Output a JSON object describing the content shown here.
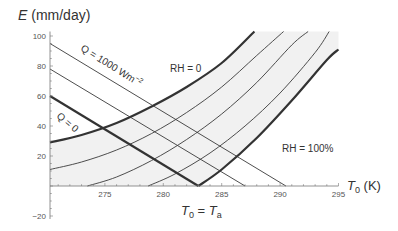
{
  "chart_data": {
    "type": "line",
    "title": "",
    "ylabel": "E (mm/day)",
    "ylabel_var": "E",
    "ylabel_unit": "(mm/day)",
    "xlabel": "T0 (K)",
    "xlabel_var": "T",
    "xlabel_sub": "0",
    "xlabel_unit": "(K)",
    "xlim": [
      270.3,
      295
    ],
    "ylim": [
      -22,
      103
    ],
    "xticks": [
      275,
      280,
      285,
      290,
      295
    ],
    "yticks": [
      -20,
      20,
      40,
      60,
      80,
      100
    ],
    "grid": false,
    "shaded_region": "between RH=0 and RH=100% curves (light gray)",
    "series": [
      {
        "name": "RH = 0",
        "group": "humidity",
        "weight": "thick",
        "points": [
          [
            270.3,
            29
          ],
          [
            273,
            34
          ],
          [
            276,
            42
          ],
          [
            279,
            53
          ],
          [
            282,
            66
          ],
          [
            285,
            82
          ],
          [
            287.8,
            103
          ]
        ]
      },
      {
        "name": "RH intermediate 1",
        "group": "humidity",
        "weight": "thin",
        "points": [
          [
            270.3,
            11
          ],
          [
            273,
            16
          ],
          [
            276,
            24
          ],
          [
            279,
            35
          ],
          [
            282,
            49
          ],
          [
            285,
            66
          ],
          [
            288,
            87
          ],
          [
            290.3,
            103
          ]
        ]
      },
      {
        "name": "RH intermediate 2",
        "group": "humidity",
        "weight": "thin",
        "points": [
          [
            273.5,
            0
          ],
          [
            276,
            6
          ],
          [
            279,
            17
          ],
          [
            282,
            31
          ],
          [
            285,
            48
          ],
          [
            288,
            69
          ],
          [
            291,
            94
          ],
          [
            292.4,
            103
          ]
        ]
      },
      {
        "name": "RH intermediate 3",
        "group": "humidity",
        "weight": "thin",
        "points": [
          [
            278.7,
            0
          ],
          [
            281,
            8
          ],
          [
            284,
            22
          ],
          [
            287,
            40
          ],
          [
            290,
            62
          ],
          [
            293,
            89
          ],
          [
            294.2,
            103
          ]
        ]
      },
      {
        "name": "RH = 100%",
        "group": "humidity",
        "weight": "thick",
        "points": [
          [
            283,
            0
          ],
          [
            285,
            11
          ],
          [
            288,
            32
          ],
          [
            291,
            57
          ],
          [
            294,
            84
          ],
          [
            295,
            91
          ]
        ]
      },
      {
        "name": "Q = 1000 Wm-2",
        "group": "energy",
        "weight": "thin",
        "points": [
          [
            270.3,
            95
          ],
          [
            290.5,
            0
          ]
        ]
      },
      {
        "name": "Q intermediate",
        "group": "energy",
        "weight": "thin",
        "points": [
          [
            270.3,
            78
          ],
          [
            287,
            0
          ]
        ]
      },
      {
        "name": "Q = 0 (left of T0 = Ta)",
        "group": "energy",
        "weight": "thick",
        "points": [
          [
            270.3,
            60
          ],
          [
            283,
            0
          ]
        ]
      }
    ],
    "annotations": [
      {
        "text": "Q = 1000 Wm",
        "sup": "−2",
        "near": [
          274.5,
          84
        ],
        "rotation": 32
      },
      {
        "text": "Q = 0",
        "near": [
          271.3,
          44
        ],
        "rotation": 38
      },
      {
        "text": "RH = 0",
        "near": [
          277.5,
          79
        ]
      },
      {
        "text": "RH = 100%",
        "near": [
          290.5,
          27
        ]
      },
      {
        "text": "T0 = Ta",
        "near": [
          283,
          -23
        ]
      }
    ]
  },
  "labels": {
    "ylabel_var": "E",
    "ylabel_unit": " (mm/day)",
    "xlabel_var": "T",
    "xlabel_sub": "0",
    "xlabel_unit": " (K)",
    "q1000": "Q = 1000 Wm",
    "q1000_sup": "−2",
    "q0": "Q = 0",
    "rh0": "RH = 0",
    "rh100": "RH = 100%",
    "tt_T": "T",
    "tt_sub0": "0",
    "tt_eq": " = ",
    "tt_Ta": "T",
    "tt_suba": "a"
  },
  "colors": {
    "line": "#3a3a3a",
    "thick_line": "#333333",
    "axis": "#777777",
    "shade": "#f1f1f1",
    "text": "#333333"
  }
}
